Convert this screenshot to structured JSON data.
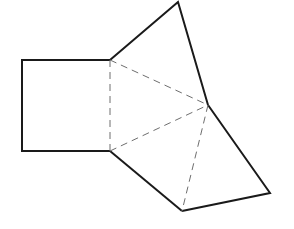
{
  "diagram": {
    "stroke_color": "#1a1a1a",
    "dash_color": "#777777",
    "background": "#ffffff",
    "vertices": {
      "square_top_left": [
        22,
        60
      ],
      "square_bottom_left": [
        22,
        151
      ],
      "square_top_right": [
        110,
        60
      ],
      "square_bottom_right": [
        110,
        151
      ],
      "apex_top": [
        178,
        2
      ],
      "center": [
        208,
        105
      ],
      "right": [
        270,
        193
      ],
      "bottom": [
        182,
        211
      ]
    },
    "solid_edges": [
      [
        "square_top_right",
        "square_top_left"
      ],
      [
        "square_top_left",
        "square_bottom_left"
      ],
      [
        "square_bottom_left",
        "square_bottom_right"
      ],
      [
        "square_top_right",
        "apex_top"
      ],
      [
        "apex_top",
        "center"
      ],
      [
        "center",
        "right"
      ],
      [
        "right",
        "bottom"
      ],
      [
        "bottom",
        "square_bottom_right"
      ]
    ],
    "dashed_edges": [
      [
        "square_top_right",
        "square_bottom_right"
      ],
      [
        "square_top_right",
        "center"
      ],
      [
        "square_bottom_right",
        "center"
      ],
      [
        "center",
        "bottom"
      ]
    ]
  }
}
